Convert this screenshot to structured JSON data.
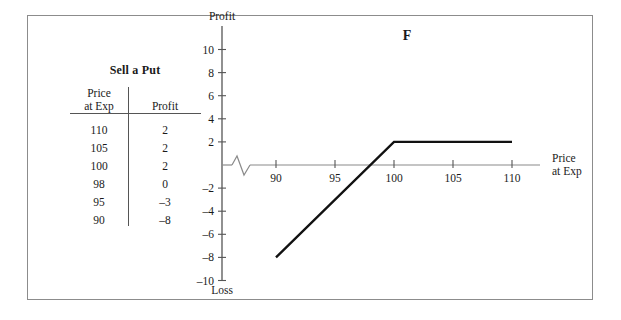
{
  "figure": {
    "panel_letter": "F",
    "border_color": "#8c8c8c"
  },
  "table": {
    "title": "Sell a Put",
    "columns": [
      "Price at Exp",
      "Profit"
    ],
    "column_head_line1": "Price",
    "column_head_line2": "at Exp",
    "column_head_right": "Profit",
    "rows": [
      {
        "price": "110",
        "profit": "2"
      },
      {
        "price": "105",
        "profit": "2"
      },
      {
        "price": "100",
        "profit": "2"
      },
      {
        "price": "98",
        "profit": "0"
      },
      {
        "price": "95",
        "profit": "–3"
      },
      {
        "price": "90",
        "profit": "–8"
      }
    ]
  },
  "chart_data": {
    "type": "line",
    "title": "F",
    "xlabel": "Price at Exp",
    "xlabel_line1": "Price",
    "xlabel_line2": "at Exp",
    "ylabel_top": "Profit",
    "ylabel_bottom": "Loss",
    "grid": false,
    "legend": "none",
    "axis_break": true,
    "xlim": [
      86,
      113
    ],
    "ylim": [
      -11,
      11
    ],
    "xticks": [
      90,
      95,
      100,
      105,
      110
    ],
    "xtick_labels": [
      "90",
      "95",
      "100",
      "105",
      "110"
    ],
    "yticks": [
      10,
      8,
      6,
      4,
      2,
      -2,
      -4,
      -6,
      -8,
      -10
    ],
    "ytick_labels": [
      "10",
      "8",
      "6",
      "4",
      "2",
      "–2",
      "–4",
      "–6",
      "–8",
      "–10"
    ],
    "series": [
      {
        "name": "Sell a Put profit",
        "x": [
          90,
          100,
          110
        ],
        "y": [
          -8,
          2,
          2
        ]
      }
    ],
    "breakeven": 98,
    "max_profit": 2,
    "strike": 100
  }
}
